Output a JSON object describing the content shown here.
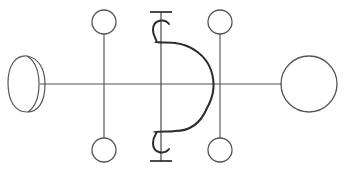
{
  "figure": {
    "canvas": {
      "width": 346,
      "height": 173
    },
    "background_color": "#ffffff",
    "stroke_color": "#2b2b30",
    "stroke_color_light": "#555558",
    "stroke_width_thin": 1.1,
    "stroke_width_medium": 1.6,
    "stroke_width_thick": 2.0
  },
  "axis": {
    "name": "horizontal-baseline",
    "y": 84,
    "x_start": 40,
    "x_end": 282
  },
  "crescent": {
    "name": "crescent-moon",
    "center_x": 27,
    "center_y": 84,
    "outer_radius": 28,
    "inner_offset_x": -12,
    "inner_radius": 27,
    "tip_top_y": 56,
    "tip_bottom_y": 112,
    "right_extent_x": 45
  },
  "left_pair": {
    "name": "left-circle-pair",
    "stem_x": 104,
    "stem_top_y": 34,
    "stem_bottom_y": 138,
    "circle_radius": 12,
    "top_circle_cy": 22,
    "bottom_circle_cy": 150
  },
  "right_pair": {
    "name": "right-circle-pair",
    "stem_x": 220,
    "stem_top_y": 34,
    "stem_bottom_y": 138,
    "circle_radius": 12,
    "top_circle_cy": 22,
    "bottom_circle_cy": 150
  },
  "center_glyph": {
    "name": "center-d-glyph",
    "axis_x": 161,
    "vertical_top_y": 12,
    "vertical_bottom_y": 161,
    "cap_top_y": 12,
    "cap_bottom_y": 161,
    "cap_half_width": 11,
    "hook_radius": 8,
    "hook_top_cy": 30,
    "hook_bottom_cy": 143,
    "bowl_top_y": 42,
    "bowl_bottom_y": 132,
    "bowl_right_x": 213
  },
  "large_circle": {
    "name": "large-right-circle",
    "cx": 309,
    "cy": 84,
    "radius": 28
  },
  "elements": [
    {
      "id": "crescent-moon",
      "label": "Crescent moon (left terminal)"
    },
    {
      "id": "horizontal-baseline",
      "label": "Horizontal baseline axis"
    },
    {
      "id": "left-circle-pair",
      "label": "Left vertical stem with two small circles"
    },
    {
      "id": "center-d-glyph",
      "label": "Central D-shaped bowl with capped vertical stem and hooks"
    },
    {
      "id": "right-circle-pair",
      "label": "Right vertical stem with two small circles"
    },
    {
      "id": "large-right-circle",
      "label": "Large circle (right terminal)"
    }
  ]
}
